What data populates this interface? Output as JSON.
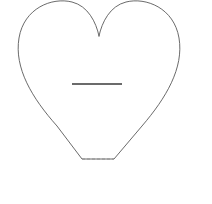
{
  "canvas": {
    "width": 212,
    "height": 204,
    "background_color": "#ffffff",
    "name": "drawing-canvas"
  },
  "shapes": {
    "heart": {
      "label": "heart-outline",
      "stroke_color": "#595959",
      "stroke_width": 0.9,
      "fill": "none",
      "bounds": {
        "x": 18,
        "y": 1,
        "width": 162,
        "height": 159
      },
      "left_lobe_peak_x": 57,
      "right_lobe_peak_x": 140,
      "top_notch": {
        "x": 99,
        "y": 36
      },
      "leftmost_x": 18,
      "rightmost_x": 180,
      "bottom_y": 159,
      "path": "M 99 36 C 96 22 88 6 72 2 C 52 -3 24 8 19 38 C 14 68 32 98 57 126 L 82 159 L 114 159 L 142 126 C 166 98 184 68 179 38 C 174 8 146 -3 126 2 C 110 6 102 22 99 36 Z"
    },
    "heart_base": {
      "label": "heart-flat-base-dashed",
      "stroke_color": "#8c8c8c",
      "stroke_width": 0.9,
      "dash_pattern": "3 2",
      "x1": 82,
      "y1": 159,
      "x2": 114,
      "y2": 159
    },
    "minus_line": {
      "label": "horizontal-line-segment",
      "stroke_color": "#6b6b6b",
      "stroke_width": 2,
      "x1": 72,
      "y1": 84,
      "x2": 122,
      "y2": 84,
      "length": 50
    }
  },
  "annotations": {
    "shape_name": "Heart",
    "element_count": "2"
  }
}
